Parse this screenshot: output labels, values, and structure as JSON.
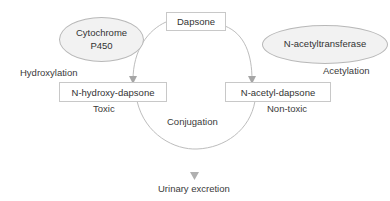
{
  "diagram": {
    "nodes": {
      "dapsone": "Dapsone",
      "cytochrome_line1": "Cytochrome",
      "cytochrome_line2": "P450",
      "n_acetyltransferase": "N-acetyltransferase",
      "n_hydroxy_dapsone": "N-hydroxy-dapsone",
      "n_acetyl_dapsone": "N-acetyl-dapsone"
    },
    "labels": {
      "hydroxylation": "Hydroxylation",
      "acetylation": "Acetylation",
      "toxic": "Toxic",
      "non_toxic": "Non-toxic",
      "conjugation": "Conjugation",
      "urinary_excretion": "Urinary excretion"
    },
    "colors": {
      "line": "#bdbdbd",
      "arrow": "#a6a6a6",
      "ellipse_fill": "#f2f2f2",
      "box_border": "#c8c8c8",
      "text": "#333333"
    }
  }
}
